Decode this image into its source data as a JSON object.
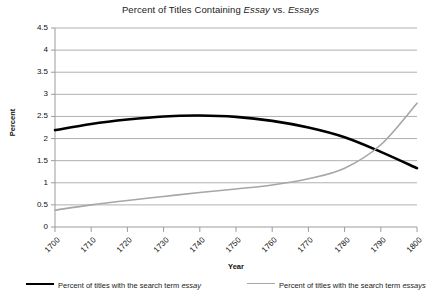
{
  "chart_data": {
    "type": "line",
    "title": "Percent of Titles Containing Essay vs. Essays",
    "title_parts": [
      {
        "text": "Percent of Titles Containing ",
        "italic": false
      },
      {
        "text": "Essay",
        "italic": true
      },
      {
        "text": " vs. ",
        "italic": false
      },
      {
        "text": "Essays",
        "italic": true
      }
    ],
    "xlabel": "Year",
    "ylabel": "Percent",
    "xlim": [
      1700,
      1800
    ],
    "ylim": [
      0,
      4.5
    ],
    "grid": true,
    "grid_axis": "y",
    "legend_position": "bottom",
    "xticks": [
      1700,
      1710,
      1720,
      1730,
      1740,
      1750,
      1760,
      1770,
      1780,
      1790,
      1800
    ],
    "xtick_labels": [
      "1700",
      "1710",
      "1720",
      "1730",
      "1740",
      "1750",
      "1760",
      "1770",
      "1780",
      "1790",
      "1800"
    ],
    "yticks": [
      0,
      0.5,
      1,
      1.5,
      2,
      2.5,
      3,
      3.5,
      4,
      4.5
    ],
    "ytick_labels": [
      "0",
      "0.5",
      "1",
      "1.5",
      "2",
      "2.5",
      "3",
      "3.5",
      "4",
      "4.5"
    ],
    "x": [
      1700,
      1710,
      1720,
      1730,
      1740,
      1750,
      1760,
      1770,
      1780,
      1790,
      1800
    ],
    "series": [
      {
        "name": "Percent of titles with the search term essay",
        "legend_parts": [
          {
            "text": "Percent of titles with the search term ",
            "italic": false
          },
          {
            "text": "essay",
            "italic": true
          }
        ],
        "color": "#000000",
        "width": 2.6,
        "values": [
          2.19,
          2.33,
          2.43,
          2.5,
          2.52,
          2.49,
          2.4,
          2.25,
          2.03,
          1.7,
          1.33
        ]
      },
      {
        "name": "Percent of titles with the search term essays",
        "legend_parts": [
          {
            "text": "Percent of titles with the search term ",
            "italic": false
          },
          {
            "text": "essays",
            "italic": true
          }
        ],
        "color": "#a6a6a6",
        "width": 1.6,
        "values": [
          0.38,
          0.5,
          0.6,
          0.69,
          0.78,
          0.86,
          0.95,
          1.09,
          1.33,
          1.86,
          2.8
        ]
      }
    ],
    "annotations": []
  }
}
